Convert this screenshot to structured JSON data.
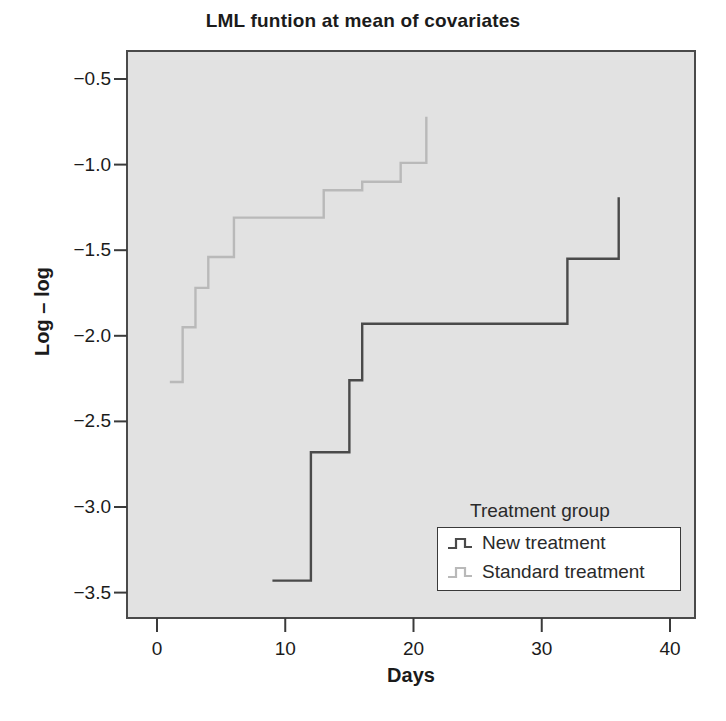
{
  "chart_data": {
    "type": "line",
    "title": "LML funtion at mean of covariates",
    "xlabel": "Days",
    "ylabel": "Log – log",
    "xlim": [
      -2,
      42
    ],
    "ylim": [
      -3.72,
      -0.28
    ],
    "xticks": [
      0,
      10,
      20,
      30,
      40
    ],
    "xtick_labels": [
      "0",
      "10",
      "20",
      "30",
      "40"
    ],
    "yticks": [
      -0.5,
      -1.0,
      -1.5,
      -2.0,
      -2.5,
      -3.0,
      -3.5
    ],
    "ytick_labels": [
      "−0.5",
      "−1.0",
      "−1.5",
      "−2.0",
      "−2.5",
      "−3.0",
      "−3.5"
    ],
    "grid": false,
    "step_type": "post",
    "plot_bgcolor": "#e2e2e2",
    "legend": {
      "title": "Treatment group",
      "position": "bottom-right",
      "entries": [
        {
          "name": "New treatment",
          "color": "#4a4a4a"
        },
        {
          "name": "Standard treatment",
          "color": "#b9b9b9"
        }
      ]
    },
    "series": [
      {
        "name": "New treatment",
        "color": "#4a4a4a",
        "x": [
          9,
          12,
          15,
          16,
          32,
          36,
          36
        ],
        "y": [
          -3.43,
          -2.68,
          -2.26,
          -1.93,
          -1.55,
          -1.19,
          -1.19
        ]
      },
      {
        "name": "Standard treatment",
        "color": "#b9b9b9",
        "x": [
          1,
          2,
          3,
          4,
          6,
          13,
          16,
          19,
          21,
          21
        ],
        "y": [
          -2.27,
          -1.95,
          -1.72,
          -1.54,
          -1.31,
          -1.15,
          -1.1,
          -0.99,
          -0.72,
          -0.72
        ]
      }
    ]
  }
}
